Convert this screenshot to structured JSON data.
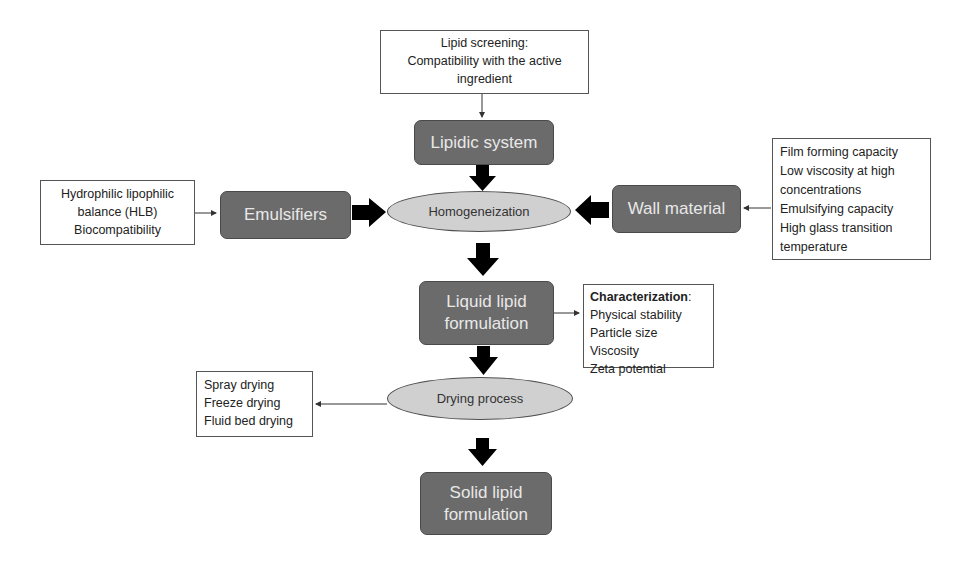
{
  "diagram": {
    "type": "flowchart",
    "nodes": {
      "lipid_screening": {
        "lines": [
          "Lipid screening:",
          "Compatibility with the active",
          "ingredient"
        ]
      },
      "lipidic_system": {
        "label": "Lipidic system"
      },
      "emulsifier_criteria": {
        "lines": [
          "Hydrophilic lipophilic",
          "balance (HLB)",
          "Biocompatibility"
        ]
      },
      "emulsifiers": {
        "label": "Emulsifiers"
      },
      "homogenization": {
        "label": "Homogeneization"
      },
      "wall_material": {
        "label": "Wall material"
      },
      "wall_material_criteria": {
        "lines": [
          "Film forming capacity",
          "Low viscosity at high",
          "concentrations",
          "Emulsifying capacity",
          "High glass transition",
          "temperature"
        ]
      },
      "liquid_lipid_formulation": {
        "lines": [
          "Liquid lipid",
          "formulation"
        ]
      },
      "characterization": {
        "title": "Characterization",
        "title_suffix": ":",
        "lines": [
          "Physical stability",
          "Particle size",
          "Viscosity",
          "Zeta potential"
        ]
      },
      "drying_process": {
        "label": "Drying process"
      },
      "drying_methods": {
        "lines": [
          "Spray drying",
          "Freeze drying",
          "Fluid bed drying"
        ]
      },
      "solid_lipid_formulation": {
        "lines": [
          "Solid lipid",
          "formulation"
        ]
      }
    },
    "edges": [
      {
        "from": "lipid_screening",
        "to": "lipidic_system",
        "style": "thin"
      },
      {
        "from": "lipidic_system",
        "to": "homogenization",
        "style": "block"
      },
      {
        "from": "emulsifier_criteria",
        "to": "emulsifiers",
        "style": "thin"
      },
      {
        "from": "emulsifiers",
        "to": "homogenization",
        "style": "block"
      },
      {
        "from": "wall_material_criteria",
        "to": "wall_material",
        "style": "thin"
      },
      {
        "from": "wall_material",
        "to": "homogenization",
        "style": "block"
      },
      {
        "from": "homogenization",
        "to": "liquid_lipid_formulation",
        "style": "block"
      },
      {
        "from": "liquid_lipid_formulation",
        "to": "characterization",
        "style": "thin"
      },
      {
        "from": "liquid_lipid_formulation",
        "to": "drying_process",
        "style": "block"
      },
      {
        "from": "drying_process",
        "to": "drying_methods",
        "style": "thin"
      },
      {
        "from": "drying_process",
        "to": "solid_lipid_formulation",
        "style": "block"
      }
    ],
    "colors": {
      "process_fill": "#6b6b6b",
      "process_text": "#e8e8e8",
      "ellipse_fill": "#d0d0d0",
      "arrow": "#000000",
      "note_border": "#555555"
    }
  }
}
